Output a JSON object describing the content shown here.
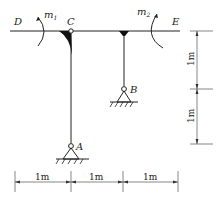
{
  "diagram": {
    "type": "frame structure",
    "nodes": {
      "D": "D",
      "C": "C",
      "E": "E",
      "B": "B",
      "A": "A"
    },
    "moments": {
      "m1": {
        "symbol": "m",
        "sub": "1"
      },
      "m2": {
        "symbol": "m",
        "sub": "2"
      }
    },
    "dimensions": {
      "vertical": [
        "1m",
        "1m"
      ],
      "horizontal": [
        "1m",
        "1m",
        "1m"
      ]
    },
    "colors": {
      "line": "#222222",
      "background": "#ffffff"
    }
  }
}
